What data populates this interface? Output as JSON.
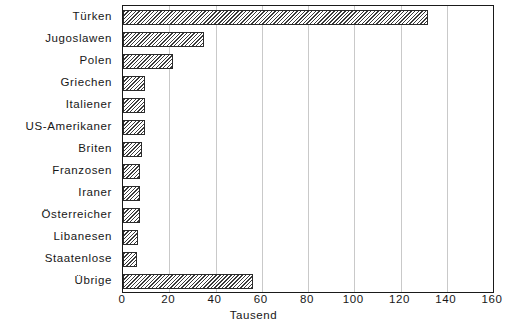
{
  "chart_data": {
    "type": "bar",
    "orientation": "horizontal",
    "title": "",
    "subtitle": "",
    "xlabel": "Tausend",
    "ylabel": "",
    "xlim": [
      0,
      160
    ],
    "xticks": [
      0,
      20,
      40,
      60,
      80,
      100,
      120,
      140,
      160
    ],
    "xtick_labels": [
      "0",
      "20",
      "40",
      "60",
      "80",
      "100",
      "120",
      "140",
      "160"
    ],
    "grid": true,
    "grid_axis": "x",
    "legend": false,
    "categories": [
      "Türken",
      "Jugoslawen",
      "Polen",
      "Griechen",
      "Italiener",
      "US-Amerikaner",
      "Briten",
      "Franzosen",
      "Iraner",
      "Österreicher",
      "Libanesen",
      "Staatenlose",
      "Übrige"
    ],
    "values": [
      132,
      35,
      21.5,
      9.5,
      9.5,
      9.5,
      8,
      7.5,
      7.5,
      7.5,
      6.5,
      6,
      56
    ],
    "units": "Tausend",
    "bar_fill": "hatched-diagonal",
    "bar_edge_color": "#2b2b2b",
    "background_color": "#ffffff"
  },
  "axis": {
    "x_title": "Tausend"
  },
  "footnote": {
    "text": ""
  }
}
